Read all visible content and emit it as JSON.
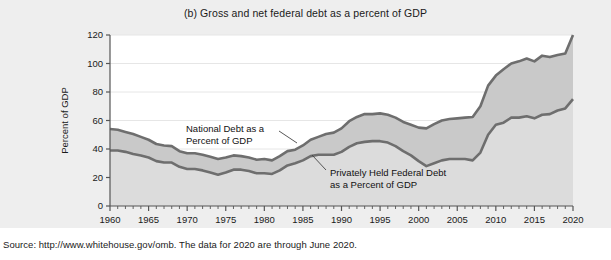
{
  "figure": {
    "title": "(b) Gross and net federal debt as a percent of GDP",
    "source": "Source: http://www.whitehouse.gov/omb. The data for 2020 are through June 2020.",
    "background_color": "#eeeeee",
    "plot_background_color": "#ffffff"
  },
  "chart_data": {
    "type": "area",
    "title": "(b) Gross and net federal debt as a percent of GDP",
    "xlabel": "Year",
    "ylabel": "Percent of GDP",
    "xlim": [
      1960,
      2020
    ],
    "ylim": [
      0,
      120
    ],
    "yticks": [
      0,
      20,
      40,
      60,
      80,
      100,
      120
    ],
    "xticks": [
      1960,
      1965,
      1970,
      1975,
      1980,
      1985,
      1990,
      1995,
      2000,
      2005,
      2010,
      2015,
      2020
    ],
    "minor_xtick_interval": 1,
    "grid": "horizontal-light",
    "legend": "annotated-inline",
    "line_color": "#6e6e6e",
    "upper_fill_color": "#c9c9c9",
    "lower_fill_color": "#dcdcdc",
    "x": [
      1960,
      1961,
      1962,
      1963,
      1964,
      1965,
      1966,
      1967,
      1968,
      1969,
      1970,
      1971,
      1972,
      1973,
      1974,
      1975,
      1976,
      1977,
      1978,
      1979,
      1980,
      1981,
      1982,
      1983,
      1984,
      1985,
      1986,
      1987,
      1988,
      1989,
      1990,
      1991,
      1992,
      1993,
      1994,
      1995,
      1996,
      1997,
      1998,
      1999,
      2000,
      2001,
      2002,
      2003,
      2004,
      2005,
      2006,
      2007,
      2008,
      2009,
      2010,
      2011,
      2012,
      2013,
      2014,
      2015,
      2016,
      2017,
      2018,
      2019,
      2020
    ],
    "series": [
      {
        "name": "National Debt as a Percent of GDP",
        "short_name": "gross-federal-debt",
        "values": [
          54.0,
          53.5,
          52.0,
          50.5,
          48.5,
          46.5,
          43.5,
          42.5,
          42.0,
          38.5,
          37.0,
          37.0,
          36.0,
          34.5,
          33.0,
          34.0,
          35.5,
          35.0,
          34.0,
          32.5,
          33.0,
          32.0,
          35.0,
          38.5,
          39.5,
          42.5,
          46.5,
          48.5,
          50.5,
          51.5,
          54.5,
          59.5,
          62.5,
          64.5,
          64.5,
          65.0,
          64.0,
          62.0,
          59.0,
          57.0,
          55.0,
          54.5,
          57.5,
          60.0,
          61.0,
          61.5,
          62.0,
          62.5,
          70.0,
          84.5,
          91.5,
          96.0,
          100.0,
          101.5,
          103.5,
          101.5,
          105.5,
          104.5,
          106.0,
          107.0,
          120.0
        ]
      },
      {
        "name": "Privately Held Federal Debt as a Percent of GDP",
        "short_name": "net-federal-debt",
        "values": [
          39.0,
          39.0,
          38.0,
          36.5,
          35.5,
          34.0,
          31.5,
          30.5,
          30.5,
          27.5,
          26.0,
          26.0,
          25.0,
          23.5,
          22.0,
          23.5,
          25.5,
          25.5,
          24.5,
          23.0,
          23.0,
          22.5,
          25.0,
          28.5,
          30.0,
          32.0,
          35.0,
          36.0,
          36.0,
          36.0,
          38.0,
          41.5,
          44.0,
          45.0,
          45.5,
          45.5,
          44.5,
          42.0,
          38.5,
          35.5,
          31.5,
          28.0,
          30.0,
          32.0,
          33.0,
          33.0,
          33.0,
          32.0,
          37.5,
          50.0,
          57.0,
          58.5,
          62.0,
          62.0,
          63.0,
          61.5,
          64.0,
          64.5,
          67.0,
          68.5,
          75.0
        ]
      }
    ],
    "annotations": [
      {
        "id": "upper-series-label",
        "line1": "National Debt as a",
        "line2": "Percent of GDP",
        "text_x": 186,
        "text_y": 132,
        "leader_from_x": 279,
        "leader_from_y": 131,
        "leader_to_x": 297,
        "leader_to_y": 143
      },
      {
        "id": "lower-series-label",
        "line1": "Privately Held Federal Debt",
        "line2": "as a Percent of GDP",
        "text_x": 330,
        "text_y": 176,
        "leader_from_x": 326,
        "leader_from_y": 170,
        "leader_to_x": 312,
        "leader_to_y": 155
      }
    ]
  }
}
